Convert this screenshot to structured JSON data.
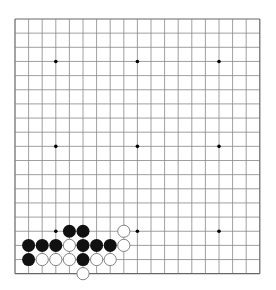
{
  "board": {
    "size": 19,
    "origin_x": 15,
    "origin_y": 19,
    "spacing_x": 13.6,
    "spacing_y": 14.15,
    "line_color": "#888888",
    "border_color": "#666666",
    "star_color": "#000000",
    "black_color": "#111111",
    "white_fill": "#ffffff",
    "white_stroke": "#666666",
    "star_points": [
      [
        3,
        3
      ],
      [
        9,
        3
      ],
      [
        15,
        3
      ],
      [
        3,
        9
      ],
      [
        9,
        9
      ],
      [
        15,
        9
      ],
      [
        3,
        15
      ],
      [
        9,
        15
      ],
      [
        15,
        15
      ]
    ],
    "black_stones": [
      [
        4,
        15
      ],
      [
        5,
        15
      ],
      [
        1,
        16
      ],
      [
        2,
        16
      ],
      [
        3,
        16
      ],
      [
        5,
        16
      ],
      [
        6,
        16
      ],
      [
        7,
        16
      ],
      [
        1,
        17
      ],
      [
        5,
        17
      ]
    ],
    "white_stones": [
      [
        8,
        15
      ],
      [
        4,
        16
      ],
      [
        8,
        16
      ],
      [
        2,
        17
      ],
      [
        3,
        17
      ],
      [
        4,
        17
      ],
      [
        6,
        17
      ],
      [
        7,
        17
      ],
      [
        5,
        18
      ]
    ]
  }
}
